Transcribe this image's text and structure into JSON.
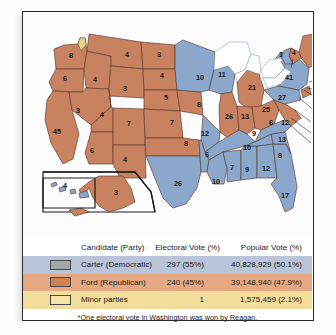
{
  "map": {
    "title_alt": "1976 Presidential Election Electoral Map",
    "colors": {
      "ford_orange": "#c8825f",
      "carter_blue": "#8ba8cc",
      "minor_yellow": "#e8d48a",
      "border": "#5a3c30",
      "water": "#ffffff"
    },
    "states": [
      {
        "name": "Washington",
        "votes": "8",
        "x": 48,
        "y": 46,
        "color": "ford"
      },
      {
        "name": "Oregon",
        "votes": "6",
        "x": 42,
        "y": 69,
        "color": "ford"
      },
      {
        "name": "California",
        "votes": "45",
        "x": 34,
        "y": 122,
        "color": "ford"
      },
      {
        "name": "Idaho",
        "votes": "4",
        "x": 72,
        "y": 70,
        "color": "ford"
      },
      {
        "name": "Nevada",
        "votes": "3",
        "x": 55,
        "y": 101,
        "color": "ford"
      },
      {
        "name": "Utah",
        "votes": "4",
        "x": 79,
        "y": 105,
        "color": "ford"
      },
      {
        "name": "Arizona",
        "votes": "6",
        "x": 69,
        "y": 141,
        "color": "ford"
      },
      {
        "name": "Montana",
        "votes": "4",
        "x": 104,
        "y": 45,
        "color": "ford"
      },
      {
        "name": "Wyoming",
        "votes": "3",
        "x": 102,
        "y": 79,
        "color": "ford"
      },
      {
        "name": "Colorado",
        "votes": "7",
        "x": 106,
        "y": 114,
        "color": "ford"
      },
      {
        "name": "New Mexico",
        "votes": "4",
        "x": 102,
        "y": 150,
        "color": "ford"
      },
      {
        "name": "North Dakota",
        "votes": "3",
        "x": 136,
        "y": 45,
        "color": "ford"
      },
      {
        "name": "South Dakota",
        "votes": "4",
        "x": 139,
        "y": 66,
        "color": "ford"
      },
      {
        "name": "Nebraska",
        "votes": "5",
        "x": 143,
        "y": 88,
        "color": "ford"
      },
      {
        "name": "Kansas",
        "votes": "7",
        "x": 149,
        "y": 113,
        "color": "ford"
      },
      {
        "name": "Oklahoma",
        "votes": "8",
        "x": 163,
        "y": 134,
        "color": "ford"
      },
      {
        "name": "Texas",
        "votes": "26",
        "x": 155,
        "y": 174,
        "color": "carter"
      },
      {
        "name": "Minnesota",
        "votes": "10",
        "x": 177,
        "y": 68,
        "color": "carter"
      },
      {
        "name": "Iowa",
        "votes": "8",
        "x": 176,
        "y": 95,
        "color": "ford"
      },
      {
        "name": "Missouri",
        "votes": "12",
        "x": 182,
        "y": 124,
        "color": "carter"
      },
      {
        "name": "Arkansas",
        "votes": "6",
        "x": 184,
        "y": 145,
        "color": "carter"
      },
      {
        "name": "Louisiana",
        "votes": "10",
        "x": 193,
        "y": 172,
        "color": "carter"
      },
      {
        "name": "Wisconsin",
        "votes": "11",
        "x": 199,
        "y": 65,
        "color": "carter"
      },
      {
        "name": "Illinois",
        "votes": "26",
        "x": 206,
        "y": 107,
        "color": "ford"
      },
      {
        "name": "Michigan",
        "votes": "21",
        "x": 229,
        "y": 78,
        "color": "ford"
      },
      {
        "name": "Indiana",
        "votes": "13",
        "x": 222,
        "y": 107,
        "color": "ford"
      },
      {
        "name": "Kentucky",
        "votes": "9",
        "x": 231,
        "y": 124,
        "color": "carter"
      },
      {
        "name": "Tennessee",
        "votes": "10",
        "x": 224,
        "y": 138,
        "color": "carter"
      },
      {
        "name": "Mississippi",
        "votes": "7",
        "x": 209,
        "y": 158,
        "color": "carter"
      },
      {
        "name": "Alabama",
        "votes": "9",
        "x": 224,
        "y": 160,
        "color": "carter"
      },
      {
        "name": "Georgia",
        "votes": "12",
        "x": 243,
        "y": 159,
        "color": "carter"
      },
      {
        "name": "Florida",
        "votes": "17",
        "x": 262,
        "y": 186,
        "color": "carter"
      },
      {
        "name": "South Carolina",
        "votes": "8",
        "x": 257,
        "y": 146,
        "color": "carter"
      },
      {
        "name": "North Carolina",
        "votes": "13",
        "x": 259,
        "y": 130,
        "color": "carter"
      },
      {
        "name": "Virginia",
        "votes": "12",
        "x": 262,
        "y": 113,
        "color": "ford"
      },
      {
        "name": "Ohio",
        "votes": "25",
        "x": 243,
        "y": 100,
        "color": "ford"
      },
      {
        "name": "West Virginia",
        "votes": "6",
        "x": 248,
        "y": 113,
        "color": "carter"
      },
      {
        "name": "Pennsylvania",
        "votes": "27",
        "x": 259,
        "y": 88,
        "color": "carter"
      },
      {
        "name": "New York",
        "votes": "41",
        "x": 266,
        "y": 68,
        "color": "carter"
      },
      {
        "name": "Maine",
        "votes": "4",
        "x": 292,
        "y": 48,
        "color": "ford"
      },
      {
        "name": "Hawaii",
        "votes": "4",
        "x": 42,
        "y": 176,
        "color": "carter"
      },
      {
        "name": "Alaska",
        "votes": "3",
        "x": 93,
        "y": 183,
        "color": "ford"
      }
    ],
    "callouts": [
      {
        "name": "Vermont",
        "votes": "3",
        "x": 256,
        "y": 45
      },
      {
        "name": "New Hampshire",
        "votes": "4",
        "x": 269,
        "y": 43
      },
      {
        "name": "Massachusetts",
        "votes": "14",
        "x": 305,
        "y": 66
      },
      {
        "name": "Rhode Island",
        "votes": "4",
        "x": 305,
        "y": 79
      },
      {
        "name": "Connecticut",
        "votes": "8",
        "x": 305,
        "y": 90
      },
      {
        "name": "New Jersey",
        "votes": "17",
        "x": 297,
        "y": 99
      },
      {
        "name": "Delaware",
        "votes": "3",
        "x": 292,
        "y": 110
      },
      {
        "name": "Maryland",
        "votes": "10",
        "x": 292,
        "y": 121
      },
      {
        "name": "DC",
        "votes": "3",
        "x": 292,
        "y": 131
      }
    ]
  },
  "legend": {
    "headers": {
      "candidate": "Candidate (Party)",
      "electoral": "Electoral Vote (%)",
      "popular": "Popular Vote (%)"
    },
    "rows": [
      {
        "candidate": "Carter (Democratic)",
        "electoral": "297 (55%)",
        "popular": "40,828,929 (50.1%)",
        "swatch": "carter-swatch"
      },
      {
        "candidate": "Ford (Republican)",
        "electoral": "240 (45%)",
        "popular": "39,148,940 (47.9%)",
        "swatch": "ford-swatch"
      },
      {
        "candidate": "Minor parties",
        "electoral": "1",
        "popular": "1,575,459 (2.1%)",
        "swatch": "minor-swatch"
      }
    ],
    "footnote": "*One electoral vote in Washington was won by Reagan."
  },
  "chart_data": {
    "type": "map",
    "legend_position": "bottom",
    "categories": [
      "Carter (Democratic)",
      "Ford (Republican)",
      "Minor parties"
    ],
    "series": [
      {
        "name": "Electoral Vote",
        "values": [
          297,
          240,
          1
        ]
      },
      {
        "name": "Electoral Vote Percent",
        "values": [
          55,
          45,
          null
        ]
      },
      {
        "name": "Popular Vote",
        "values": [
          40828929,
          39148940,
          1575459
        ]
      },
      {
        "name": "Popular Vote Percent",
        "values": [
          50.1,
          47.9,
          2.1
        ]
      }
    ],
    "state_values": {
      "Washington": 8,
      "Oregon": 6,
      "California": 45,
      "Idaho": 4,
      "Nevada": 3,
      "Utah": 4,
      "Arizona": 6,
      "Montana": 4,
      "Wyoming": 3,
      "Colorado": 7,
      "New Mexico": 4,
      "North Dakota": 3,
      "South Dakota": 4,
      "Nebraska": 5,
      "Kansas": 7,
      "Oklahoma": 8,
      "Texas": 26,
      "Minnesota": 10,
      "Iowa": 8,
      "Missouri": 12,
      "Arkansas": 6,
      "Louisiana": 10,
      "Wisconsin": 11,
      "Illinois": 26,
      "Michigan": 21,
      "Indiana": 13,
      "Kentucky": 9,
      "Tennessee": 10,
      "Mississippi": 7,
      "Alabama": 9,
      "Georgia": 12,
      "Florida": 17,
      "South Carolina": 8,
      "North Carolina": 13,
      "Virginia": 12,
      "Ohio": 25,
      "West Virginia": 6,
      "Pennsylvania": 27,
      "New York": 41,
      "Maine": 4,
      "Hawaii": 4,
      "Alaska": 3,
      "Vermont": 3,
      "New Hampshire": 4,
      "Massachusetts": 14,
      "Rhode Island": 4,
      "Connecticut": 8,
      "New Jersey": 17,
      "Delaware": 3,
      "Maryland": 10,
      "DC": 3
    },
    "annotations": [
      "*One electoral vote in Washington was won by Reagan."
    ]
  }
}
